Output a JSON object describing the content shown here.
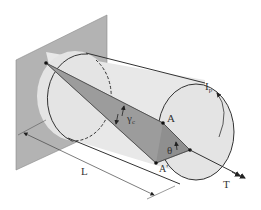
{
  "diagram": {
    "type": "torsion-of-circular-shaft",
    "labels": {
      "point_a": "A",
      "point_a_prime": "A'",
      "angle_theta": "θ",
      "shear_strain": "γ",
      "shear_strain_subscript": "c",
      "length": "L",
      "torque": "T",
      "polar_moment": "I",
      "polar_moment_subscript": "p"
    },
    "colors": {
      "wall": "#b3b3b3",
      "shaft_body": "#e8e8e8",
      "shaft_end": "#e0e0e0",
      "twist_region": "#8f8f8f",
      "outline": "#333333"
    }
  }
}
